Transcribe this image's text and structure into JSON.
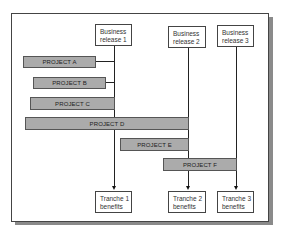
{
  "releases": [
    {
      "label": "Business\nrelease 1"
    },
    {
      "label": "Business\nrelease 2"
    },
    {
      "label": "Business\nrelease 3"
    }
  ],
  "tranches": [
    {
      "label": "Tranche 1\nbenefits"
    },
    {
      "label": "Tranche 2\nbenefits"
    },
    {
      "label": "Tranche 3\nbenefits"
    }
  ],
  "projects": [
    {
      "label": "PROJECT A",
      "feeds": "Business release 1"
    },
    {
      "label": "PROJECT B",
      "feeds": "Business release 1"
    },
    {
      "label": "PROJECT C",
      "feeds": "Business release 1"
    },
    {
      "label": "PROJECT D",
      "feeds": "Business release 2"
    },
    {
      "label": "PROJECT E",
      "feeds": "Business release 2"
    },
    {
      "label": "PROJECT F",
      "feeds": "Business release 3"
    }
  ],
  "colors": {
    "bar_fill": "#ababab",
    "shadow": "#8a8a8a",
    "line": "#222222"
  }
}
